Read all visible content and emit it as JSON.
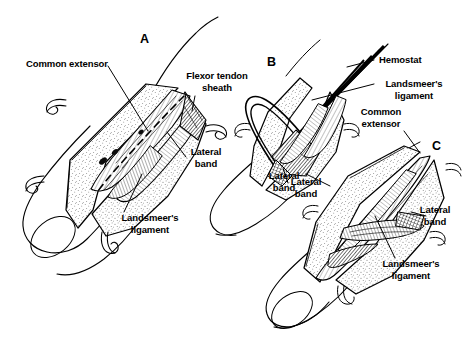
{
  "figure": {
    "background_color": "#ffffff",
    "ink_color": "#000000",
    "panel_count": 3
  },
  "panels": [
    {
      "letter": "A",
      "caption": "Initial exposure: skin flaps retracted with skin hooks, common extensor tendon and lateral band visible over the proximal phalanx"
    },
    {
      "letter": "B",
      "caption": "Landsmeer's ligament isolated and elevated on a hemostat"
    },
    {
      "letter": "C",
      "caption": "After release of Landsmeer's ligament, lateral bands freed"
    }
  ],
  "labels": [
    {
      "id": "a-common-extensor",
      "text": "Common extensor",
      "panel": "A",
      "align": "left"
    },
    {
      "id": "a-flexor-sheath",
      "text": "Flexor tendon\nsheath",
      "panel": "A",
      "align": "center"
    },
    {
      "id": "a-lateral-band",
      "text": "Lateral\nband",
      "panel": "A",
      "align": "center"
    },
    {
      "id": "a-landsmeer",
      "text": "Landsmeer's\nligament",
      "panel": "A",
      "align": "center"
    },
    {
      "id": "b-hemostat",
      "text": "Hemostat",
      "panel": "B",
      "align": "left"
    },
    {
      "id": "b-landsmeer",
      "text": "Landsmeer's\nligament",
      "panel": "B",
      "align": "center"
    },
    {
      "id": "b-common-extensor",
      "text": "Common\nextensor",
      "panel": "B",
      "align": "center"
    },
    {
      "id": "b-lateral-band",
      "text": "Lateral\nband",
      "panel": "B",
      "align": "center"
    },
    {
      "id": "c-lateral-band",
      "text": "Lateral\nband",
      "panel": "C",
      "align": "center"
    },
    {
      "id": "c-landsmeer",
      "text": "Landsmeer's\nligament",
      "panel": "C",
      "align": "center"
    }
  ]
}
